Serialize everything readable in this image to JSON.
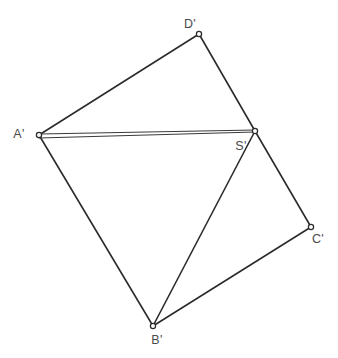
{
  "figure": {
    "canvas": {
      "width": 338,
      "height": 358
    },
    "background_color": "#ffffff",
    "stroke_color": "#2b2b2b",
    "label_color": "#4a4a4a",
    "vertex_fill": "#ffffff"
  },
  "points": {
    "A": {
      "label": "A'",
      "x": 39,
      "y": 135,
      "label_x": 19,
      "label_y": 135
    },
    "B": {
      "label": "B'",
      "x": 153,
      "y": 326,
      "label_x": 152,
      "label_y": 340
    },
    "C": {
      "label": "C'",
      "x": 311,
      "y": 227,
      "label_x": 313,
      "label_y": 239
    },
    "D": {
      "label": "D'",
      "x": 199,
      "y": 34,
      "label_x": 185,
      "label_y": 23
    },
    "S": {
      "label": "S'",
      "x": 255,
      "y": 131,
      "label_x": 236,
      "label_y": 146
    }
  },
  "edges": {
    "ad": {
      "name": "A'D'",
      "d": "M 39 135 L 199 34"
    },
    "ds": {
      "name": "D'S'",
      "d": "M 199 34 L 255 131"
    },
    "sc": {
      "name": "S'C'",
      "d": "M 255 131 L 311 227"
    },
    "cb": {
      "name": "C'B'",
      "d": "M 311 227 L 153 326"
    },
    "ba": {
      "name": "B'A'",
      "d": "M 153 326 L 39 135"
    },
    "as_upper": {
      "name": "A'S'-upper",
      "d": "M 39 134 L 255 130"
    },
    "as_lower": {
      "name": "A'S'-lower",
      "d": "M 39 138 L 255 132"
    },
    "sb": {
      "name": "S'B'",
      "d": "M 255 131 L 153 326"
    }
  },
  "vertex_marker": {
    "radius": 2.6
  }
}
